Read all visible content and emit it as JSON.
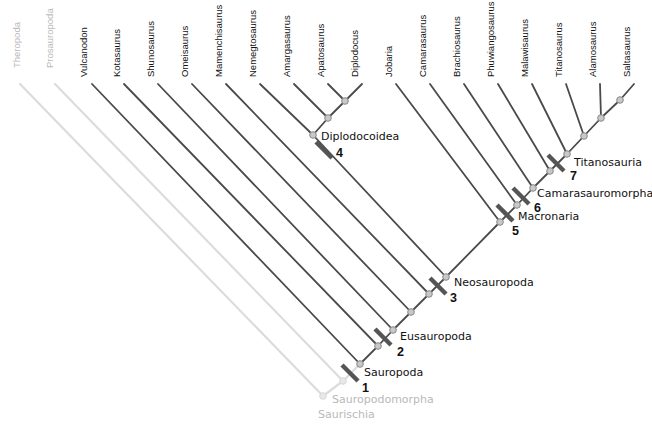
{
  "diagram": {
    "type": "cladogram",
    "colors": {
      "branch": "#4a4a4a",
      "branch_faded": "#dcdcdc",
      "label": "#111111",
      "label_faded": "#b9b9b9",
      "node_fill": "#c8c8c8",
      "node_fill_faded": "#e8e8e8",
      "synapomorphy_bar": "#555555"
    },
    "taxa": [
      {
        "name": "Theropoda",
        "x": 20,
        "y": 68,
        "faded": true
      },
      {
        "name": "Prosauropoda",
        "x": 53,
        "y": 68,
        "faded": true
      },
      {
        "name": "Vulcanodon",
        "x": 87,
        "y": 77,
        "faded": false
      },
      {
        "name": "Kotasaurus",
        "x": 120,
        "y": 77,
        "faded": false
      },
      {
        "name": "Shunosaurus",
        "x": 154,
        "y": 77,
        "faded": false
      },
      {
        "name": "Omeisaurus",
        "x": 188,
        "y": 77,
        "faded": false
      },
      {
        "name": "Mamenchisaurus",
        "x": 222,
        "y": 77,
        "faded": false
      },
      {
        "name": "Nemegtosaurus",
        "x": 256,
        "y": 77,
        "faded": false
      },
      {
        "name": "Amargasaurus",
        "x": 290,
        "y": 77,
        "faded": false
      },
      {
        "name": "Apatosaurus",
        "x": 324,
        "y": 77,
        "faded": false
      },
      {
        "name": "Diplodocus",
        "x": 358,
        "y": 77,
        "faded": false
      },
      {
        "name": "Jobaria",
        "x": 392,
        "y": 77,
        "faded": false
      },
      {
        "name": "Camarasaurus",
        "x": 426,
        "y": 77,
        "faded": false
      },
      {
        "name": "Brachiosaurus",
        "x": 460,
        "y": 77,
        "faded": false
      },
      {
        "name": "Phuwiangosaurus",
        "x": 494,
        "y": 77,
        "faded": false
      },
      {
        "name": "Malawisaurus",
        "x": 528,
        "y": 77,
        "faded": false
      },
      {
        "name": "Titanosaurus",
        "x": 562,
        "y": 77,
        "faded": false
      },
      {
        "name": "Alamosaurus",
        "x": 596,
        "y": 77,
        "faded": false
      },
      {
        "name": "Saltasaurus",
        "x": 630,
        "y": 77,
        "faded": false
      }
    ],
    "clades": [
      {
        "name": "Saurischia",
        "number": "",
        "faded": true,
        "label_x": 318,
        "label_y": 418
      },
      {
        "name": "Sauropodomorpha",
        "number": "",
        "faded": true,
        "label_x": 332,
        "label_y": 403
      },
      {
        "name": "Sauropoda",
        "number": "1",
        "faded": false,
        "label_x": 364,
        "label_y": 376,
        "num_x": 362,
        "num_y": 392
      },
      {
        "name": "Eusauropoda",
        "number": "2",
        "faded": false,
        "label_x": 400,
        "label_y": 340,
        "num_x": 397,
        "num_y": 356
      },
      {
        "name": "Neosauropoda",
        "number": "3",
        "faded": false,
        "label_x": 454,
        "label_y": 286,
        "num_x": 450,
        "num_y": 302
      },
      {
        "name": "Diplodocoidea",
        "number": "4",
        "faded": false,
        "label_x": 321,
        "label_y": 140,
        "num_x": 336,
        "num_y": 157
      },
      {
        "name": "Macronaria",
        "number": "5",
        "faded": false,
        "label_x": 518,
        "label_y": 220,
        "num_x": 512,
        "num_y": 235
      },
      {
        "name": "Camarasauromorpha",
        "number": "6",
        "faded": false,
        "label_x": 537,
        "label_y": 197,
        "num_x": 534,
        "num_y": 212
      },
      {
        "name": "Titanosauria",
        "number": "7",
        "faded": false,
        "label_x": 574,
        "label_y": 166,
        "num_x": 570,
        "num_y": 180
      }
    ]
  }
}
